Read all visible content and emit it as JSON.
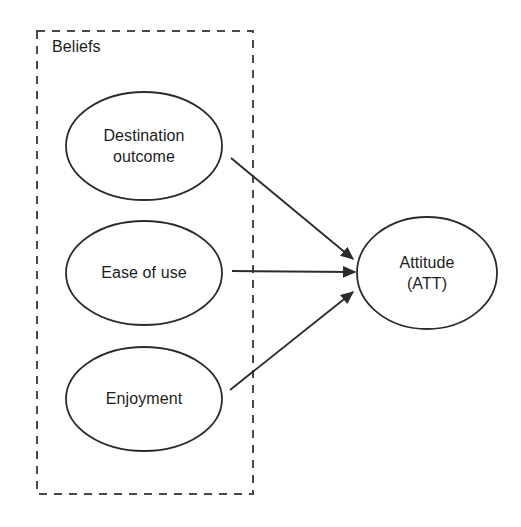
{
  "canvas": {
    "width": 521,
    "height": 527,
    "background": "#ffffff",
    "stroke_color": "#2b2b2b",
    "text_color": "#1c1c1c"
  },
  "group": {
    "name": "beliefs-group",
    "title": "Beliefs",
    "border_style": "dashed",
    "x": 37,
    "y": 31,
    "width": 216,
    "height": 463
  },
  "nodes": [
    {
      "id": "destination-outcome",
      "shape": "ellipse",
      "lines": [
        "Destination",
        "outcome"
      ],
      "cx": 144,
      "cy": 146,
      "rx": 78,
      "ry": 54
    },
    {
      "id": "ease-of-use",
      "shape": "ellipse",
      "lines": [
        "Ease of use"
      ],
      "cx": 144,
      "cy": 273,
      "rx": 78,
      "ry": 52
    },
    {
      "id": "enjoyment",
      "shape": "ellipse",
      "lines": [
        "Enjoyment"
      ],
      "cx": 144,
      "cy": 399,
      "rx": 78,
      "ry": 52
    },
    {
      "id": "attitude",
      "shape": "ellipse",
      "lines": [
        "Attitude",
        "(ATT)"
      ],
      "cx": 427,
      "cy": 273,
      "rx": 70,
      "ry": 56
    }
  ],
  "edges": [
    {
      "id": "destination-outcome-to-attitude",
      "from": "destination-outcome",
      "to": "attitude",
      "x1": 231,
      "y1": 158,
      "x2": 356,
      "y2": 262,
      "arrowhead": "end"
    },
    {
      "id": "ease-of-use-to-attitude",
      "from": "ease-of-use",
      "to": "attitude",
      "x1": 232,
      "y1": 271,
      "x2": 358,
      "y2": 272,
      "arrowhead": "end"
    },
    {
      "id": "enjoyment-to-attitude",
      "from": "enjoyment",
      "to": "attitude",
      "x1": 230,
      "y1": 390,
      "x2": 356,
      "y2": 289,
      "arrowhead": "end"
    }
  ]
}
